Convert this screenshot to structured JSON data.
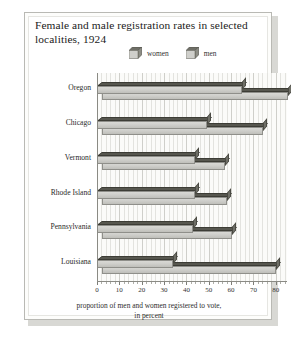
{
  "chart": {
    "title": "Female and male registration rates in selected localities, 1924",
    "caption_line1": "proportion of men and women registered to vote,",
    "caption_line2": "in percent",
    "legend": [
      {
        "label": "women",
        "icon": "cube-icon",
        "color": "#cfcfcb"
      },
      {
        "label": "men",
        "icon": "cube-icon",
        "color": "#cfcfcb"
      }
    ]
  },
  "chart_data": {
    "type": "bar",
    "orientation": "horizontal",
    "title": "Female and male registration rates in selected localities, 1924",
    "xlabel": "proportion of men and women registered to vote, in percent",
    "ylabel": "",
    "categories": [
      "Oregon",
      "Chicago",
      "Vermont",
      "Rhode Island",
      "Pennsylvania",
      "Louisiana"
    ],
    "series": [
      {
        "name": "women",
        "values": [
          65,
          49,
          44,
          44,
          43,
          34
        ]
      },
      {
        "name": "men",
        "values": [
          83,
          72,
          55,
          56,
          58,
          78
        ]
      }
    ],
    "xlim": [
      0,
      85
    ],
    "xticks": [
      0,
      10,
      20,
      30,
      40,
      50,
      60,
      70,
      80
    ],
    "xticklabels": [
      "0",
      "10",
      "20",
      "30",
      "40",
      "50",
      "60",
      "70",
      "80"
    ],
    "grid": true,
    "grid_axis": "x",
    "legend_position": "top-right",
    "style": "3d"
  }
}
